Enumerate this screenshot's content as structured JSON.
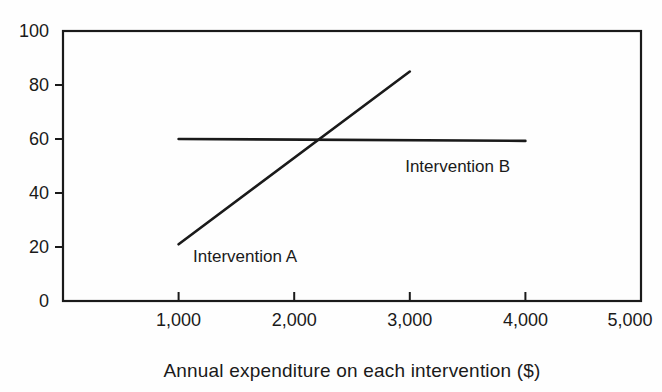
{
  "colors": {
    "ink": "#1a1a1a",
    "background": "#ffffff"
  },
  "chart_data": {
    "type": "line",
    "title": "",
    "xlabel": "Annual expenditure on each intervention ($)",
    "ylabel": "",
    "xlim": [
      0,
      5000
    ],
    "ylim": [
      0,
      100
    ],
    "grid": false,
    "frame": true,
    "legend_position": "none",
    "x_ticks": [
      1000,
      2000,
      3000,
      4000,
      5000
    ],
    "x_tick_labels": [
      "1,000",
      "2,000",
      "3,000",
      "4,000",
      "5,000"
    ],
    "y_ticks": [
      0,
      20,
      40,
      60,
      80,
      100
    ],
    "y_tick_labels": [
      "0",
      "20",
      "40",
      "60",
      "80",
      "100"
    ],
    "series": [
      {
        "name": "Intervention A",
        "x": [
          1000,
          3000
        ],
        "y": [
          21,
          85
        ],
        "color": "#1a1a1a"
      },
      {
        "name": "Intervention B",
        "x": [
          1000,
          4000
        ],
        "y": [
          60,
          59.3
        ],
        "color": "#1a1a1a"
      }
    ],
    "annotations": [
      {
        "text": "Intervention A",
        "x": 1125,
        "y": 16.5,
        "anchor": "start"
      },
      {
        "text": "Intervention B",
        "x": 2960,
        "y": 50,
        "anchor": "start"
      }
    ],
    "crossing_point_approx": {
      "x": 2200,
      "y": 59
    }
  }
}
